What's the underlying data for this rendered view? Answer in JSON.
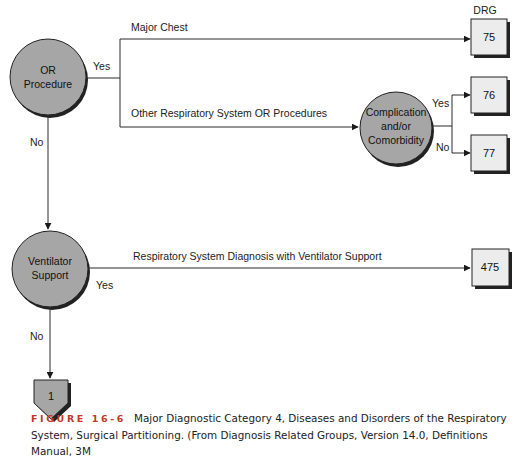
{
  "diagram": {
    "header": "DRG",
    "nodes": {
      "or_procedure": [
        "OR",
        "Procedure"
      ],
      "complication": [
        "Complication",
        "and/or",
        "Comorbidity"
      ],
      "ventilator": [
        "Ventilator",
        "Support"
      ],
      "connector": "1"
    },
    "edges": {
      "or_yes": "Yes",
      "or_no": "No",
      "major_chest": "Major Chest",
      "other_resp": "Other Respiratory System OR Procedures",
      "cc_yes": "Yes",
      "cc_no": "No",
      "resp_vent": "Respiratory System Diagnosis with Ventilator Support",
      "vent_yes": "Yes",
      "vent_no": "No"
    },
    "drg_boxes": {
      "major_chest": "75",
      "cc_yes": "76",
      "cc_no": "77",
      "ventilator": "475"
    }
  },
  "caption": {
    "figure_label": "FIGURE 16-6",
    "line1": "Major Diagnostic Category 4, Diseases and Disorders of the Respiratory",
    "line2": "System, Surgical Partitioning. (From Diagnosis Related Groups, Version 14.0, Definitions Manual, 3M"
  },
  "colors": {
    "node_fill": "#a6a6a6",
    "box_fill": "#ececec",
    "line": "#2b2b2b",
    "figure_label": "#c0392b"
  }
}
